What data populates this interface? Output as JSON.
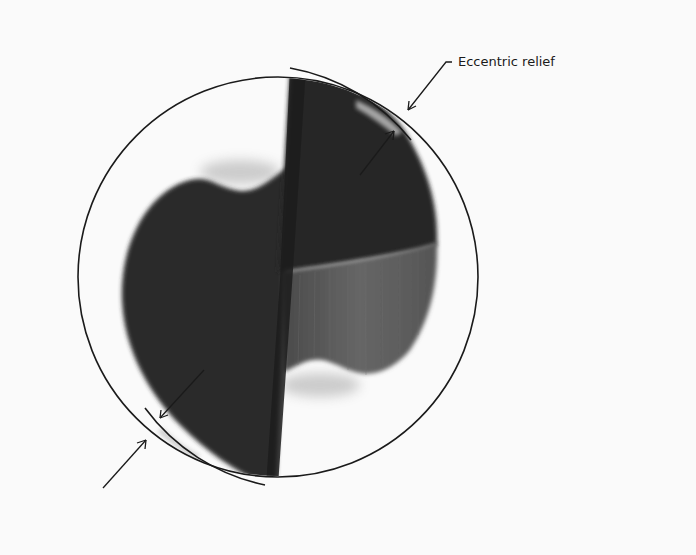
{
  "figure": {
    "annotations": [
      {
        "id": "eccentric-relief",
        "label": "Eccentric relief"
      }
    ],
    "colors": {
      "background": "#fafafa",
      "outline": "#1a1a1a",
      "drill_dark": "#2b2b2b",
      "drill_darker": "#1c1c1c",
      "drill_face_gray": "#5a5a5a",
      "land_highlight": "#bdbdbd"
    }
  }
}
